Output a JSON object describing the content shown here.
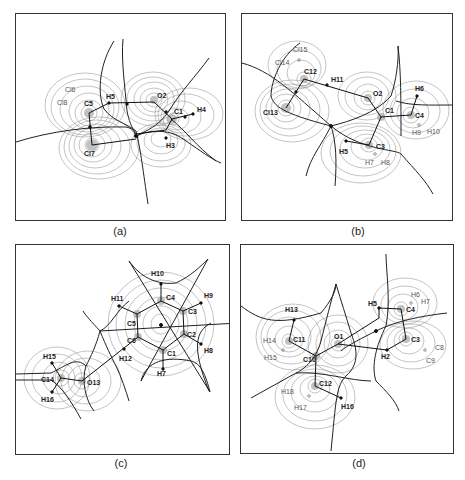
{
  "figure": {
    "panels": [
      {
        "id": "a",
        "caption": "(a)",
        "atoms": [
          {
            "label": "Cl6",
            "x": 72,
            "y": 88,
            "kind": "out-of-plane"
          },
          {
            "label": "Cl8",
            "x": 66,
            "y": 101,
            "kind": "out-of-plane"
          },
          {
            "label": "C5",
            "x": 87,
            "y": 111,
            "kind": "nucleus"
          },
          {
            "label": "H5",
            "x": 108,
            "y": 95,
            "kind": "nucleus"
          },
          {
            "label": "O2",
            "x": 153,
            "y": 99,
            "kind": "nucleus"
          },
          {
            "label": "C1",
            "x": 171,
            "y": 117,
            "kind": "nucleus"
          },
          {
            "label": "H4",
            "x": 193,
            "y": 113,
            "kind": "nucleus"
          },
          {
            "label": "Cl7",
            "x": 90,
            "y": 144,
            "kind": "nucleus"
          },
          {
            "label": "H3",
            "x": 165,
            "y": 137,
            "kind": "nucleus"
          }
        ]
      },
      {
        "id": "b",
        "caption": "(b)",
        "atoms": [
          {
            "label": "Cl15",
            "x": 300,
            "y": 48,
            "kind": "out-of-plane"
          },
          {
            "label": "Cl14",
            "x": 281,
            "y": 62,
            "kind": "out-of-plane"
          },
          {
            "label": "C12",
            "x": 303,
            "y": 77,
            "kind": "nucleus"
          },
          {
            "label": "H11",
            "x": 330,
            "y": 82,
            "kind": "nucleus"
          },
          {
            "label": "O2",
            "x": 367,
            "y": 96,
            "kind": "nucleus"
          },
          {
            "label": "H6",
            "x": 417,
            "y": 93,
            "kind": "nucleus"
          },
          {
            "label": "Cl13",
            "x": 284,
            "y": 106,
            "kind": "nucleus"
          },
          {
            "label": "C1",
            "x": 380,
            "y": 115,
            "kind": "nucleus"
          },
          {
            "label": "C4",
            "x": 410,
            "y": 113,
            "kind": "nucleus"
          },
          {
            "label": "H9",
            "x": 412,
            "y": 129,
            "kind": "out-of-plane"
          },
          {
            "label": "H10",
            "x": 430,
            "y": 129,
            "kind": "out-of-plane"
          },
          {
            "label": "H5",
            "x": 345,
            "y": 142,
            "kind": "nucleus"
          },
          {
            "label": "C3",
            "x": 368,
            "y": 143,
            "kind": "nucleus"
          },
          {
            "label": "H7",
            "x": 369,
            "y": 158,
            "kind": "out-of-plane"
          },
          {
            "label": "H8",
            "x": 384,
            "y": 158,
            "kind": "out-of-plane"
          }
        ]
      },
      {
        "id": "c",
        "caption": "(c)",
        "atoms": [
          {
            "label": "H10",
            "x": 158,
            "y": 271,
            "kind": "nucleus"
          },
          {
            "label": "C4",
            "x": 160,
            "y": 300,
            "kind": "nucleus"
          },
          {
            "label": "H9",
            "x": 203,
            "y": 293,
            "kind": "nucleus"
          },
          {
            "label": "H11",
            "x": 119,
            "y": 297,
            "kind": "nucleus"
          },
          {
            "label": "C5",
            "x": 136,
            "y": 313,
            "kind": "nucleus"
          },
          {
            "label": "C3",
            "x": 182,
            "y": 310,
            "kind": "nucleus"
          },
          {
            "label": "C6",
            "x": 137,
            "y": 336,
            "kind": "nucleus"
          },
          {
            "label": "C2",
            "x": 183,
            "y": 333,
            "kind": "nucleus"
          },
          {
            "label": "H8",
            "x": 204,
            "y": 350,
            "kind": "nucleus"
          },
          {
            "label": "H12",
            "x": 123,
            "y": 355,
            "kind": "nucleus"
          },
          {
            "label": "C1",
            "x": 162,
            "y": 349,
            "kind": "nucleus"
          },
          {
            "label": "H7",
            "x": 163,
            "y": 370,
            "kind": "nucleus"
          },
          {
            "label": "H15",
            "x": 49,
            "y": 356,
            "kind": "nucleus"
          },
          {
            "label": "C14",
            "x": 60,
            "y": 377,
            "kind": "nucleus"
          },
          {
            "label": "O13",
            "x": 80,
            "y": 379,
            "kind": "nucleus"
          },
          {
            "label": "H16",
            "x": 49,
            "y": 396,
            "kind": "nucleus"
          }
        ]
      },
      {
        "id": "d",
        "caption": "(d)",
        "atoms": [
          {
            "label": "H6",
            "x": 411,
            "y": 294,
            "kind": "out-of-plane"
          },
          {
            "label": "H7",
            "x": 420,
            "y": 298,
            "kind": "out-of-plane"
          },
          {
            "label": "H5",
            "x": 378,
            "y": 302,
            "kind": "nucleus"
          },
          {
            "label": "C4",
            "x": 400,
            "y": 307,
            "kind": "nucleus"
          },
          {
            "label": "H13",
            "x": 293,
            "y": 306,
            "kind": "nucleus"
          },
          {
            "label": "C11",
            "x": 288,
            "y": 339,
            "kind": "nucleus"
          },
          {
            "label": "O1",
            "x": 337,
            "y": 342,
            "kind": "nucleus"
          },
          {
            "label": "C3",
            "x": 405,
            "y": 337,
            "kind": "nucleus"
          },
          {
            "label": "H14",
            "x": 263,
            "y": 339,
            "kind": "out-of-plane"
          },
          {
            "label": "C8",
            "x": 436,
            "y": 345,
            "kind": "out-of-plane"
          },
          {
            "label": "C10",
            "x": 315,
            "y": 355,
            "kind": "nucleus"
          },
          {
            "label": "H15",
            "x": 266,
            "y": 355,
            "kind": "out-of-plane"
          },
          {
            "label": "H2",
            "x": 386,
            "y": 348,
            "kind": "nucleus"
          },
          {
            "label": "C9",
            "x": 429,
            "y": 358,
            "kind": "out-of-plane"
          },
          {
            "label": "C12",
            "x": 314,
            "y": 384,
            "kind": "nucleus"
          },
          {
            "label": "H18",
            "x": 287,
            "y": 390,
            "kind": "out-of-plane"
          },
          {
            "label": "H17",
            "x": 300,
            "y": 405,
            "kind": "out-of-plane"
          },
          {
            "label": "H16",
            "x": 345,
            "y": 404,
            "kind": "nucleus"
          }
        ]
      }
    ]
  }
}
